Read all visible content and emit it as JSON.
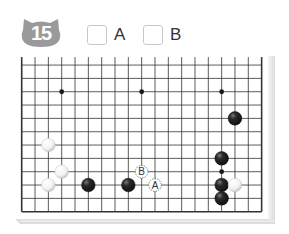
{
  "problem": {
    "number": "15",
    "badge_color": "#9a9a9a",
    "badge_shape": "cat-head-icon"
  },
  "choices": [
    {
      "label": "A",
      "checked": false
    },
    {
      "label": "B",
      "checked": false
    }
  ],
  "board": {
    "size": 19,
    "visible_rows": 12,
    "top_open": true,
    "line_color": "#333333",
    "star_points": [
      {
        "col": 3,
        "row": 9
      },
      {
        "col": 9,
        "row": 9
      },
      {
        "col": 15,
        "row": 9
      },
      {
        "col": 3,
        "row": 3
      },
      {
        "col": 9,
        "row": 3
      },
      {
        "col": 15,
        "row": 3
      }
    ],
    "stones": [
      {
        "color": "black",
        "col": 16,
        "row": 7
      },
      {
        "color": "black",
        "col": 15,
        "row": 4
      },
      {
        "color": "black",
        "col": 15,
        "row": 2
      },
      {
        "color": "black",
        "col": 15,
        "row": 1
      },
      {
        "color": "black",
        "col": 5,
        "row": 2
      },
      {
        "color": "black",
        "col": 8,
        "row": 2
      },
      {
        "color": "white",
        "col": 16,
        "row": 2
      },
      {
        "color": "white",
        "col": 2,
        "row": 5
      },
      {
        "color": "white",
        "col": 3,
        "row": 3
      },
      {
        "color": "white",
        "col": 2,
        "row": 2
      }
    ],
    "markers": [
      {
        "label": "A",
        "col": 10,
        "row": 2
      },
      {
        "label": "B",
        "col": 9,
        "row": 3
      }
    ]
  }
}
